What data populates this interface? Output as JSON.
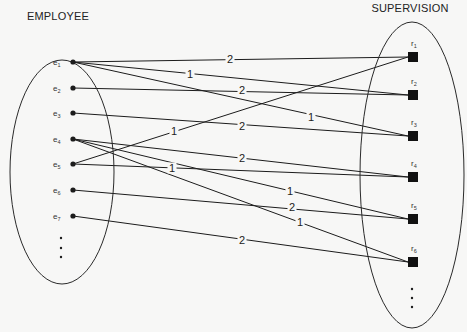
{
  "diagram": {
    "type": "bipartite-mapping",
    "left_set": {
      "title": "EMPLOYEE",
      "ellipse": {
        "cx": 62,
        "cy": 172,
        "rx": 52,
        "ry": 112
      },
      "title_pos": {
        "x": 58,
        "y": 20
      },
      "nodes": [
        {
          "id": "e1",
          "base": "e",
          "sub": "1",
          "x": 73,
          "y": 62
        },
        {
          "id": "e2",
          "base": "e",
          "sub": "2",
          "x": 73,
          "y": 88
        },
        {
          "id": "e3",
          "base": "e",
          "sub": "3",
          "x": 73,
          "y": 113
        },
        {
          "id": "e4",
          "base": "e",
          "sub": "4",
          "x": 73,
          "y": 139
        },
        {
          "id": "e5",
          "base": "e",
          "sub": "5",
          "x": 73,
          "y": 164
        },
        {
          "id": "e6",
          "base": "e",
          "sub": "6",
          "x": 73,
          "y": 190
        },
        {
          "id": "e7",
          "base": "e",
          "sub": "7",
          "x": 73,
          "y": 216
        }
      ],
      "ellipsis_dots": [
        {
          "x": 61,
          "y": 238
        },
        {
          "x": 61,
          "y": 248
        },
        {
          "x": 61,
          "y": 257
        }
      ]
    },
    "right_set": {
      "title": "SUPERVISION",
      "ellipse": {
        "cx": 412,
        "cy": 175,
        "rx": 52,
        "ry": 153
      },
      "title_pos": {
        "x": 410,
        "y": 12
      },
      "nodes": [
        {
          "id": "r1",
          "base": "r",
          "sub": "1",
          "x": 413,
          "y": 57
        },
        {
          "id": "r2",
          "base": "r",
          "sub": "2",
          "x": 413,
          "y": 95
        },
        {
          "id": "r3",
          "base": "r",
          "sub": "3",
          "x": 413,
          "y": 136
        },
        {
          "id": "r4",
          "base": "r",
          "sub": "4",
          "x": 413,
          "y": 177
        },
        {
          "id": "r5",
          "base": "r",
          "sub": "5",
          "x": 413,
          "y": 219
        },
        {
          "id": "r6",
          "base": "r",
          "sub": "6",
          "x": 413,
          "y": 262
        }
      ],
      "ellipsis_dots": [
        {
          "x": 412,
          "y": 289
        },
        {
          "x": 412,
          "y": 298
        },
        {
          "x": 412,
          "y": 307
        }
      ]
    },
    "edges": [
      {
        "from": "e1",
        "to": "r1",
        "label": "2",
        "lx": 230,
        "ly": 59
      },
      {
        "from": "e1",
        "to": "r2",
        "label": "1",
        "lx": 190,
        "ly": 74
      },
      {
        "from": "e1",
        "to": "r3",
        "label": "1",
        "lx": 311,
        "ly": 117
      },
      {
        "from": "e2",
        "to": "r2",
        "label": "2",
        "lx": 242,
        "ly": 90
      },
      {
        "from": "e3",
        "to": "r3",
        "label": "2",
        "lx": 242,
        "ly": 126
      },
      {
        "from": "e5",
        "to": "r1",
        "label": "1",
        "lx": 174,
        "ly": 131
      },
      {
        "from": "e4",
        "to": "r4",
        "label": "2",
        "lx": 242,
        "ly": 158
      },
      {
        "from": "e5",
        "to": "r4",
        "label": "1",
        "lx": 172,
        "ly": 168
      },
      {
        "from": "e4",
        "to": "r5",
        "label": "1",
        "lx": 290,
        "ly": 191
      },
      {
        "from": "e6",
        "to": "r5",
        "label": "2",
        "lx": 292,
        "ly": 207
      },
      {
        "from": "e4",
        "to": "r6",
        "label": "1",
        "lx": 300,
        "ly": 222
      },
      {
        "from": "e7",
        "to": "r6",
        "label": "2",
        "lx": 242,
        "ly": 240
      }
    ],
    "colors": {
      "background": "#f7f7f6",
      "ink": "#1c1c1c"
    }
  }
}
